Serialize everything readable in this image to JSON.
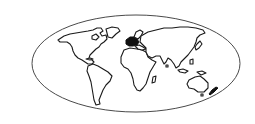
{
  "map": {
    "projection": "elliptical world map outline",
    "frame": {
      "cx": 136,
      "cy": 63.5,
      "rx": 104,
      "ry": 48.5,
      "color": "#4a4a4a"
    },
    "land_color": "#ffffff",
    "outline_color": "#1a1a1a",
    "highlight_color": "#111111",
    "highlighted_region": "Europe",
    "continents": [
      "North America",
      "South America",
      "Greenland",
      "Europe",
      "Africa",
      "Asia",
      "Australia",
      "New Zealand"
    ]
  }
}
